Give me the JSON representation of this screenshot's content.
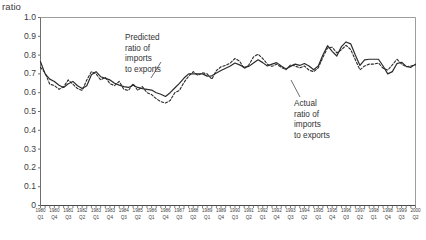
{
  "chart_data": {
    "type": "line",
    "title": "",
    "ylabel": "ratio",
    "xlabel": "",
    "ylim": [
      0,
      1.0
    ],
    "grid": false,
    "legend_position": "annotations",
    "ytick_labels": [
      "1.0",
      "0.9",
      "0.8",
      "0.7",
      "0.6",
      "0.5",
      "0.4",
      "0.3",
      "0.2",
      "0.1",
      "0"
    ],
    "ytick_values": [
      1.0,
      0.9,
      0.8,
      0.7,
      0.6,
      0.5,
      0.4,
      0.3,
      0.2,
      0.1,
      0
    ],
    "x_labeled_ticks": [
      {
        "year": "1980",
        "quarter": "Q1"
      },
      {
        "year": "1980",
        "quarter": "Q4"
      },
      {
        "year": "1981",
        "quarter": "Q3"
      },
      {
        "year": "1982",
        "quarter": "Q2"
      },
      {
        "year": "1983",
        "quarter": "Q1"
      },
      {
        "year": "1983",
        "quarter": "Q4"
      },
      {
        "year": "1984",
        "quarter": "Q3"
      },
      {
        "year": "1985",
        "quarter": "Q2"
      },
      {
        "year": "1986",
        "quarter": "Q1"
      },
      {
        "year": "1986",
        "quarter": "Q4"
      },
      {
        "year": "1987",
        "quarter": "Q3"
      },
      {
        "year": "1988",
        "quarter": "Q2"
      },
      {
        "year": "1989",
        "quarter": "Q1"
      },
      {
        "year": "1989",
        "quarter": "Q4"
      },
      {
        "year": "1990",
        "quarter": "Q3"
      },
      {
        "year": "1991",
        "quarter": "Q2"
      },
      {
        "year": "1992",
        "quarter": "Q1"
      },
      {
        "year": "1992",
        "quarter": "Q4"
      },
      {
        "year": "1993",
        "quarter": "Q3"
      },
      {
        "year": "1994",
        "quarter": "Q2"
      },
      {
        "year": "1995",
        "quarter": "Q1"
      },
      {
        "year": "1995",
        "quarter": "Q4"
      },
      {
        "year": "1996",
        "quarter": "Q3"
      },
      {
        "year": "1997",
        "quarter": "Q2"
      },
      {
        "year": "1998",
        "quarter": "Q1"
      },
      {
        "year": "1998",
        "quarter": "Q4"
      },
      {
        "year": "1999",
        "quarter": "Q3"
      },
      {
        "year": "2000",
        "quarter": "Q2"
      }
    ],
    "x": [
      "1980 Q1",
      "1980 Q2",
      "1980 Q3",
      "1980 Q4",
      "1981 Q1",
      "1981 Q2",
      "1981 Q3",
      "1981 Q4",
      "1982 Q1",
      "1982 Q2",
      "1982 Q3",
      "1982 Q4",
      "1983 Q1",
      "1983 Q2",
      "1983 Q3",
      "1983 Q4",
      "1984 Q1",
      "1984 Q2",
      "1984 Q3",
      "1984 Q4",
      "1985 Q1",
      "1985 Q2",
      "1985 Q3",
      "1985 Q4",
      "1986 Q1",
      "1986 Q2",
      "1986 Q3",
      "1986 Q4",
      "1987 Q1",
      "1987 Q2",
      "1987 Q3",
      "1987 Q4",
      "1988 Q1",
      "1988 Q2",
      "1988 Q3",
      "1988 Q4",
      "1989 Q1",
      "1989 Q2",
      "1989 Q3",
      "1989 Q4",
      "1990 Q1",
      "1990 Q2",
      "1990 Q3",
      "1990 Q4",
      "1991 Q1",
      "1991 Q2",
      "1991 Q3",
      "1991 Q4",
      "1992 Q1",
      "1992 Q2",
      "1992 Q3",
      "1992 Q4",
      "1993 Q1",
      "1993 Q2",
      "1993 Q3",
      "1993 Q4",
      "1994 Q1",
      "1994 Q2",
      "1994 Q3",
      "1994 Q4",
      "1995 Q1",
      "1995 Q2",
      "1995 Q3",
      "1995 Q4",
      "1996 Q1",
      "1996 Q2",
      "1996 Q3",
      "1996 Q4",
      "1997 Q1",
      "1997 Q2",
      "1997 Q3",
      "1997 Q4",
      "1998 Q1",
      "1998 Q2",
      "1998 Q3",
      "1998 Q4",
      "1999 Q1",
      "1999 Q2",
      "1999 Q3",
      "1999 Q4",
      "2000 Q1",
      "2000 Q2"
    ],
    "series": [
      {
        "name": "Actual ratio of imports to exports",
        "style": "solid",
        "color": "#2b2b2b",
        "values": [
          0.765,
          0.7,
          0.672,
          0.66,
          0.64,
          0.628,
          0.648,
          0.66,
          0.637,
          0.622,
          0.637,
          0.695,
          0.712,
          0.685,
          0.676,
          0.668,
          0.65,
          0.64,
          0.632,
          0.628,
          0.64,
          0.628,
          0.622,
          0.618,
          0.614,
          0.6,
          0.592,
          0.58,
          0.6,
          0.625,
          0.65,
          0.678,
          0.7,
          0.7,
          0.7,
          0.7,
          0.688,
          0.69,
          0.705,
          0.718,
          0.73,
          0.742,
          0.758,
          0.748,
          0.735,
          0.74,
          0.758,
          0.775,
          0.76,
          0.742,
          0.752,
          0.76,
          0.742,
          0.726,
          0.74,
          0.752,
          0.745,
          0.755,
          0.742,
          0.722,
          0.742,
          0.8,
          0.85,
          0.82,
          0.795,
          0.845,
          0.87,
          0.86,
          0.8,
          0.745,
          0.775,
          0.778,
          0.778,
          0.778,
          0.742,
          0.7,
          0.712,
          0.755,
          0.762,
          0.74,
          0.735,
          0.752
        ]
      },
      {
        "name": "Predicted ratio of imports to exports",
        "style": "dashed",
        "color": "#2b2b2b",
        "values": [
          0.735,
          0.705,
          0.645,
          0.638,
          0.618,
          0.632,
          0.668,
          0.645,
          0.622,
          0.612,
          0.668,
          0.712,
          0.7,
          0.668,
          0.682,
          0.648,
          0.638,
          0.66,
          0.618,
          0.612,
          0.648,
          0.612,
          0.632,
          0.6,
          0.59,
          0.568,
          0.552,
          0.545,
          0.558,
          0.6,
          0.612,
          0.655,
          0.688,
          0.712,
          0.692,
          0.706,
          0.7,
          0.672,
          0.718,
          0.738,
          0.745,
          0.758,
          0.782,
          0.768,
          0.728,
          0.748,
          0.79,
          0.805,
          0.782,
          0.752,
          0.74,
          0.752,
          0.735,
          0.722,
          0.748,
          0.742,
          0.732,
          0.742,
          0.72,
          0.712,
          0.732,
          0.788,
          0.838,
          0.842,
          0.812,
          0.828,
          0.852,
          0.83,
          0.775,
          0.722,
          0.742,
          0.752,
          0.752,
          0.758,
          0.73,
          0.72,
          0.748,
          0.778,
          0.752,
          0.738,
          0.742,
          0.748
        ]
      }
    ],
    "annotations": [
      {
        "id": "predicted",
        "text": "Predicted\nratio of\nimports\nto exports",
        "target_series": "Predicted ratio of imports to exports"
      },
      {
        "id": "actual",
        "text": "Actual\nratio of\nimports\nto exports",
        "target_series": "Actual ratio of imports to exports"
      }
    ]
  }
}
